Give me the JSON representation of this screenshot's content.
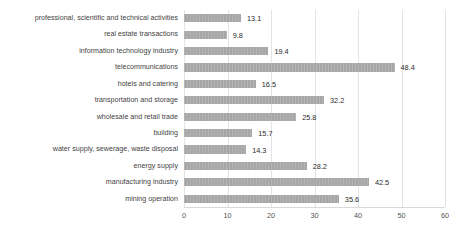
{
  "chart_data": {
    "type": "bar",
    "orientation": "horizontal",
    "title": "",
    "subtitle": "",
    "xlabel": "",
    "ylabel": "",
    "xlim": [
      0,
      60
    ],
    "xticks": [
      0,
      10,
      20,
      30,
      40,
      50,
      60
    ],
    "grid": true,
    "legend": false,
    "legend_position": "none",
    "bar_color": "#a6a6a6",
    "label_color": "#3f3f3f",
    "value_label_color": "#2b2b2b",
    "gridline_color": "#e4e4e4",
    "background_color": "#ffffff",
    "categories": [
      "professional, scientific and technical activities",
      "real estate transactions",
      "information technology industry",
      "telecommunications",
      "hotels and catering",
      "transportation and storage",
      "wholesale and retail trade",
      "building",
      "water supply, sewerage, waste disposal",
      "energy supply",
      "manufacturing industry",
      "mining operation"
    ],
    "values": [
      13.1,
      9.8,
      19.4,
      48.4,
      16.5,
      32.2,
      25.8,
      15.7,
      14.3,
      28.2,
      42.5,
      35.6
    ],
    "value_labels": [
      "13.1",
      "9.8",
      "19.4",
      "48.4",
      "16.5",
      "32.2",
      "25.8",
      "15.7",
      "14.3",
      "28.2",
      "42.5",
      "35.6"
    ],
    "xtick_labels": [
      "0",
      "10",
      "20",
      "30",
      "40",
      "50",
      "60"
    ]
  }
}
